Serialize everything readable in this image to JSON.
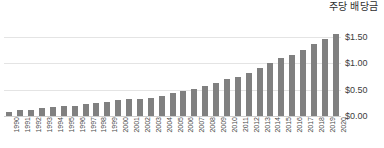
{
  "chart_data": {
    "type": "bar",
    "title": "주당 배당금",
    "xlabel": "",
    "ylabel": "",
    "ylim": [
      0,
      1.75
    ],
    "grid": true,
    "legend": "none",
    "y_ticks": [
      "$0.00",
      "$0.50",
      "$1.00",
      "$1.50"
    ],
    "y_tick_values": [
      0,
      0.5,
      1.0,
      1.5
    ],
    "bar_color": "#808080",
    "gridline_color": "#e4e4e4",
    "categories": [
      "1990",
      "1991",
      "1992",
      "1993",
      "1994",
      "1995",
      "1996",
      "1997",
      "1998",
      "1999",
      "2000",
      "2001",
      "2002",
      "2003",
      "2004",
      "2005",
      "2006",
      "2007",
      "2008",
      "2009",
      "2010",
      "2011",
      "2012",
      "2013",
      "2014",
      "2015",
      "2016",
      "2017",
      "2018",
      "2019",
      "2020"
    ],
    "values": [
      0.07,
      0.11,
      0.12,
      0.15,
      0.18,
      0.19,
      0.19,
      0.23,
      0.25,
      0.26,
      0.3,
      0.32,
      0.33,
      0.34,
      0.38,
      0.44,
      0.48,
      0.52,
      0.58,
      0.63,
      0.7,
      0.75,
      0.82,
      0.92,
      1.0,
      1.1,
      1.17,
      1.25,
      1.37,
      1.47,
      1.56
    ]
  }
}
